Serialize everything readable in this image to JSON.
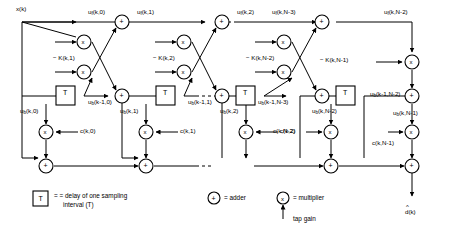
{
  "diagram": {
    "input_label": "x(k)",
    "output_label": "d(k)",
    "forward_labels": [
      "u (k,0)",
      "u (k,1)",
      "u (k,2)",
      "u (k,N-3)",
      "u (k,N-2)"
    ],
    "forward_sub": "f",
    "backward_sub": "b",
    "backward_delayed_labels": [
      "u (k-1,0)",
      "u (k-1,1)",
      "u (k-1,N-3)",
      "u (k-1,N-2)"
    ],
    "backward_labels": [
      "u (k,0)",
      "u (k,1)",
      "u (k,2)",
      "u (k,N-2)",
      "u (k,N-1)"
    ],
    "reflection_labels": [
      "− K(k,1)",
      "− K(k,2)",
      "− K(k,N-2)",
      "− K(k,N-1)"
    ],
    "tap_gain_labels": [
      "c(k,0)",
      "c(k,1)",
      "c(k,2)",
      "c(k,N-2)",
      "c(k,N-1)"
    ],
    "delay_symbol": "T",
    "adder_symbol": "+",
    "multiplier_symbol": "x",
    "line_color": "#000000"
  },
  "legend": {
    "delay_symbol": "T",
    "delay_text_line1": "= delay of one sampling",
    "delay_text_line2": "interval (T)",
    "adder_symbol": "+",
    "adder_text": "= adder",
    "multiplier_symbol": "x",
    "multiplier_text": "= multiplier",
    "tap_gain_text": "tap gain"
  }
}
